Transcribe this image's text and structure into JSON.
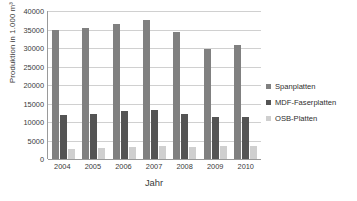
{
  "chart_data": {
    "type": "bar",
    "title": "",
    "xlabel": "Jahr",
    "ylabel": "Produktion  in  1.000  m³",
    "categories": [
      "2004",
      "2005",
      "2006",
      "2007",
      "2008",
      "2009",
      "2010"
    ],
    "ylim": [
      0,
      40000
    ],
    "yticks": [
      40000,
      35000,
      30000,
      25000,
      20000,
      15000,
      10000,
      5000,
      0
    ],
    "ytick_labels": [
      "40000",
      "35000",
      "30000",
      "25000",
      "20000",
      "15000",
      "10000",
      "5000",
      "0"
    ],
    "grid": true,
    "legend_position": "right",
    "series": [
      {
        "name": "Spanplatten",
        "color": "#808080",
        "values": [
          34900,
          35300,
          36500,
          37700,
          34400,
          29600,
          30800
        ]
      },
      {
        "name": "MDF-Faserplatten",
        "color": "#545454",
        "values": [
          11800,
          12100,
          12950,
          13250,
          12200,
          11350,
          11400
        ]
      },
      {
        "name": "OSB-Platten",
        "color": "#cfcfcf",
        "values": [
          2650,
          3000,
          3350,
          3650,
          3200,
          3450,
          3550
        ]
      }
    ]
  },
  "legend": {
    "items": [
      {
        "label": "Spanplatten"
      },
      {
        "label": "MDF-Faserplatten"
      },
      {
        "label": "OSB-Platten"
      }
    ]
  },
  "axes": {
    "x_title": "Jahr",
    "y_title": "Produktion  in  1.000  m³"
  }
}
